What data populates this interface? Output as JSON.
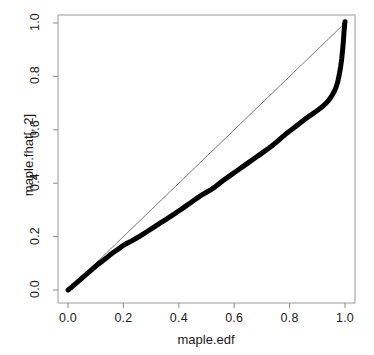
{
  "chart_data": {
    "type": "line",
    "title": "",
    "subtitle": "",
    "xlabel": "maple.edf",
    "ylabel": "maple.fhat[, 2]",
    "xlim": [
      0.0,
      1.0
    ],
    "ylim": [
      0.0,
      1.0
    ],
    "grid": false,
    "legend": null,
    "legend_position": "none",
    "xticks": [
      "0.0",
      "0.2",
      "0.4",
      "0.6",
      "0.8",
      "1.0"
    ],
    "xtick_values": [
      0.0,
      0.2,
      0.4,
      0.6,
      0.8,
      1.0
    ],
    "yticks": [
      "0.0",
      "0.2",
      "0.4",
      "0.6",
      "0.8",
      "1.0"
    ],
    "ytick_values": [
      0.0,
      0.2,
      0.4,
      0.6,
      0.8,
      1.0
    ],
    "box_border": true,
    "series": [
      {
        "name": "reference-line",
        "type": "line",
        "style": "identity y = x diagonal",
        "color": "#555555",
        "width": 0.8,
        "x": [
          0.0,
          1.0
        ],
        "values": [
          0.0,
          1.0
        ]
      },
      {
        "name": "maple.fhat[, 2] vs maple.edf",
        "type": "line",
        "style": "thick dense points",
        "color": "#000000",
        "width": 5,
        "x": [
          0.0,
          0.01,
          0.02,
          0.03,
          0.04,
          0.05,
          0.06,
          0.07,
          0.08,
          0.09,
          0.1,
          0.11,
          0.12,
          0.13,
          0.14,
          0.15,
          0.16,
          0.17,
          0.18,
          0.19,
          0.2,
          0.215,
          0.23,
          0.245,
          0.26,
          0.275,
          0.29,
          0.305,
          0.32,
          0.335,
          0.35,
          0.365,
          0.38,
          0.395,
          0.41,
          0.425,
          0.44,
          0.455,
          0.47,
          0.485,
          0.5,
          0.515,
          0.53,
          0.545,
          0.56,
          0.575,
          0.59,
          0.605,
          0.62,
          0.635,
          0.65,
          0.665,
          0.68,
          0.695,
          0.71,
          0.725,
          0.74,
          0.755,
          0.77,
          0.785,
          0.8,
          0.815,
          0.83,
          0.845,
          0.86,
          0.875,
          0.89,
          0.905,
          0.92,
          0.935,
          0.945,
          0.955,
          0.962,
          0.968,
          0.974,
          0.979,
          0.984,
          0.988,
          0.991,
          0.994,
          0.996,
          0.998,
          0.999,
          1.0
        ],
        "values": [
          0.0,
          0.008,
          0.017,
          0.026,
          0.035,
          0.044,
          0.053,
          0.062,
          0.071,
          0.08,
          0.089,
          0.097,
          0.105,
          0.113,
          0.121,
          0.13,
          0.138,
          0.145,
          0.152,
          0.16,
          0.167,
          0.176,
          0.184,
          0.193,
          0.202,
          0.212,
          0.222,
          0.232,
          0.242,
          0.252,
          0.262,
          0.272,
          0.282,
          0.293,
          0.303,
          0.314,
          0.325,
          0.336,
          0.347,
          0.357,
          0.366,
          0.375,
          0.385,
          0.398,
          0.41,
          0.421,
          0.432,
          0.443,
          0.454,
          0.465,
          0.476,
          0.487,
          0.498,
          0.509,
          0.52,
          0.531,
          0.543,
          0.556,
          0.57,
          0.583,
          0.595,
          0.607,
          0.619,
          0.631,
          0.643,
          0.654,
          0.665,
          0.676,
          0.688,
          0.703,
          0.716,
          0.732,
          0.745,
          0.76,
          0.78,
          0.805,
          0.835,
          0.865,
          0.895,
          0.93,
          0.96,
          0.985,
          0.998,
          1.005
        ]
      }
    ]
  },
  "colors": {
    "data_line": "#000000",
    "reference_line": "#555555",
    "axis": "#777777",
    "box": "#999999",
    "text": "#1a1a1a",
    "background": "#ffffff"
  },
  "axes": {
    "x_title": "maple.edf",
    "y_title": "maple.fhat[, 2]"
  }
}
